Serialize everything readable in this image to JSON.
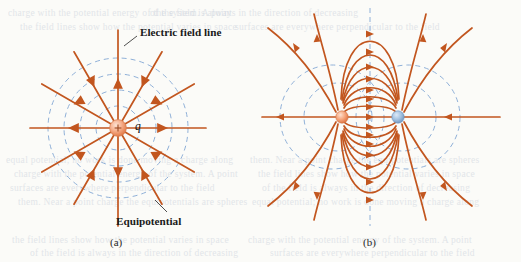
{
  "figure": {
    "background_color": "#fbfbf8",
    "field_line_color": "#c2561f",
    "equipotential_color": "#8fb0d8",
    "positive_charge_color": "#f3a07a",
    "negative_charge_color": "#8fb4d8",
    "label_color": "#1a1a1a"
  },
  "annotations": {
    "field_line_label": "Electric field line",
    "equipotential_label": "Equipotential",
    "charge_symbol": "q",
    "charge_sign": "+"
  },
  "panels": [
    {
      "id": "a",
      "caption": "(a)",
      "description": "Single positive point charge",
      "center": {
        "x": 118,
        "y": 128
      },
      "charge_count": 1,
      "charges": [
        {
          "sign": "+",
          "label": "q",
          "x": 118,
          "y": 128,
          "radius": 8,
          "color": "#f3a07a"
        }
      ],
      "field_line_count": 12,
      "field_line_angle_step_deg": 30,
      "field_line_length": 88,
      "arrow_direction": "outward",
      "equipotential_count": 4,
      "equipotential_radii": [
        22,
        38,
        54,
        70
      ]
    },
    {
      "id": "b",
      "caption": "(b)",
      "description": "Electric dipole: equal and opposite point charges",
      "charge_count": 2,
      "charges": [
        {
          "sign": "+",
          "label": "",
          "x": 342,
          "y": 117,
          "radius": 6,
          "color": "#f3a07a"
        },
        {
          "sign": "-",
          "label": "",
          "x": 398,
          "y": 117,
          "radius": 6,
          "color": "#8fb4d8"
        }
      ],
      "equipotential_circle_radii": [
        34,
        52,
        78
      ],
      "has_midplane_equipotential": true,
      "arrow_direction": "from positive to negative"
    }
  ],
  "background_lines": [
    "charge with the potential energy of the system. A point",
    "of the field is always in the direction of decreasing",
    "the field lines show how the potential varies in space",
    "surfaces are everywhere perpendicular to the field",
    "equal potential; no work is done moving a charge along",
    "them. Near a point charge the equipotentials are spheres"
  ]
}
